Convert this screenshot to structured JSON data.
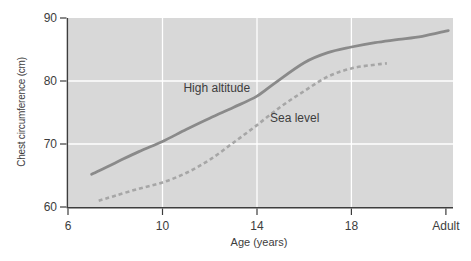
{
  "figure": {
    "background": "#ffffff",
    "text_color": "#3d3d3d"
  },
  "chart_data": {
    "type": "line",
    "title": "",
    "xlabel": "Age (years)",
    "ylabel": "Chest circumference (cm)",
    "xlim": [
      6,
      22.3
    ],
    "ylim": [
      60,
      90
    ],
    "grid_on": true,
    "plot_background": "#d8d8d8",
    "grid_color": "#ffffff",
    "axis_color": "#3d3d3d",
    "legend_position": "inline-labels",
    "x_ticks": [
      {
        "value": 6,
        "label": "6"
      },
      {
        "value": 10,
        "label": "10"
      },
      {
        "value": 14,
        "label": "14"
      },
      {
        "value": 18,
        "label": "18"
      },
      {
        "value": 22,
        "label": "Adult"
      }
    ],
    "y_ticks": [
      {
        "value": 60,
        "label": "60"
      },
      {
        "value": 70,
        "label": "70"
      },
      {
        "value": 80,
        "label": "80"
      },
      {
        "value": 90,
        "label": "90"
      }
    ],
    "grid": {
      "x_values": [
        10,
        14,
        18
      ],
      "y_values": [
        70,
        80
      ]
    },
    "series": [
      {
        "name": "High altitude",
        "line_style": "solid",
        "color": "#8a8a8a",
        "label_anchor": {
          "x": 12.3,
          "y": 78.9
        },
        "points": [
          [
            7.0,
            65.2
          ],
          [
            8,
            67.0
          ],
          [
            9,
            68.8
          ],
          [
            10,
            70.4
          ],
          [
            11,
            72.3
          ],
          [
            12,
            74.1
          ],
          [
            13,
            75.8
          ],
          [
            14,
            77.6
          ],
          [
            14.8,
            79.8
          ],
          [
            16,
            82.9
          ],
          [
            17,
            84.5
          ],
          [
            18,
            85.4
          ],
          [
            19,
            86.1
          ],
          [
            20,
            86.6
          ],
          [
            21,
            87.1
          ],
          [
            22.1,
            88.0
          ]
        ]
      },
      {
        "name": "Sea level",
        "line_style": "dashed",
        "color": "#a6a6a6",
        "label_anchor": {
          "x": 15.6,
          "y": 74.2
        },
        "points": [
          [
            7.3,
            61.0
          ],
          [
            8,
            61.8
          ],
          [
            9,
            62.9
          ],
          [
            10,
            63.9
          ],
          [
            11,
            65.4
          ],
          [
            12,
            67.5
          ],
          [
            13,
            70.2
          ],
          [
            14,
            73.0
          ],
          [
            15,
            75.9
          ],
          [
            16,
            78.4
          ],
          [
            17,
            80.7
          ],
          [
            18,
            82.0
          ],
          [
            19,
            82.6
          ],
          [
            19.5,
            82.8
          ]
        ]
      }
    ]
  }
}
